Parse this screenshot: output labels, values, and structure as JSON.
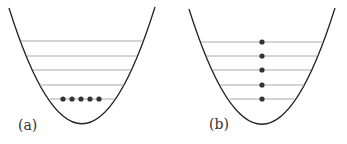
{
  "panels": [
    {
      "label": "(a)",
      "description": "Parabolic potential well with five energy levels; five particles all occupy the lowest level",
      "levels": 5,
      "particles_per_level": [
        5,
        0,
        0,
        0,
        0
      ]
    },
    {
      "label": "(b)",
      "description": "Parabolic potential well with five energy levels; one particle on each level",
      "levels": 5,
      "particles_per_level": [
        1,
        1,
        1,
        1,
        1
      ]
    }
  ],
  "colors": {
    "curve": "#222222",
    "level_line": "#aaaaaa",
    "particle": "#333333"
  }
}
